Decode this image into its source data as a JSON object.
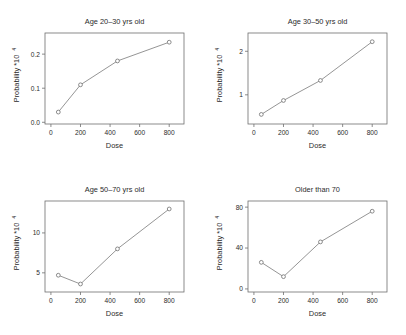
{
  "figure": {
    "title": "",
    "panel_count": 4,
    "layout": "2x2 grid of line charts",
    "shared_xlabel": "Dose",
    "shared_ylabel": "Probability *10",
    "ylabel_superscript": "4"
  },
  "chart_data": [
    {
      "type": "line",
      "title": "Age 20–30 yrs old",
      "xlabel": "Dose",
      "ylabel": "Probability *10⁴",
      "x": [
        50,
        200,
        450,
        800
      ],
      "values": [
        0.03,
        0.11,
        0.18,
        0.235
      ],
      "xticks": [
        0,
        200,
        400,
        600,
        800
      ],
      "xticklabels": [
        "0",
        "200",
        "400",
        "600",
        "800"
      ],
      "yticks": [
        0.0,
        0.1,
        0.2
      ],
      "yticklabels": [
        "0.0",
        "0.1",
        "0.2"
      ],
      "xlim": [
        -40,
        900
      ],
      "ylim": [
        -0.005,
        0.262
      ],
      "grid": false,
      "legend": "none",
      "marker": "open-circle"
    },
    {
      "type": "line",
      "title": "Age 30–50 yrs old",
      "xlabel": "Dose",
      "ylabel": "Probability *10⁴",
      "x": [
        50,
        200,
        450,
        800
      ],
      "values": [
        0.55,
        0.87,
        1.33,
        2.22
      ],
      "xticks": [
        0,
        200,
        400,
        600,
        800
      ],
      "xticklabels": [
        "0",
        "200",
        "400",
        "600",
        "800"
      ],
      "yticks": [
        1,
        2
      ],
      "yticklabels": [
        "1",
        "2"
      ],
      "xlim": [
        -40,
        900
      ],
      "ylim": [
        0.33,
        2.42
      ],
      "grid": false,
      "legend": "none",
      "marker": "open-circle"
    },
    {
      "type": "line",
      "title": "Age 50–70 yrs old",
      "xlabel": "Dose",
      "ylabel": "Probability *10⁴",
      "x": [
        50,
        200,
        450,
        800
      ],
      "values": [
        4.7,
        3.6,
        8.0,
        13.0
      ],
      "xticks": [
        0,
        200,
        400,
        600,
        800
      ],
      "xticklabels": [
        "0",
        "200",
        "400",
        "600",
        "800"
      ],
      "yticks": [
        5,
        10
      ],
      "yticklabels": [
        "5",
        "10"
      ],
      "xlim": [
        -40,
        900
      ],
      "ylim": [
        2.6,
        14.0
      ],
      "grid": false,
      "legend": "none",
      "marker": "open-circle"
    },
    {
      "type": "line",
      "title": "Older than 70",
      "xlabel": "Dose",
      "ylabel": "Probability *10⁴",
      "x": [
        50,
        200,
        450,
        800
      ],
      "values": [
        26,
        12,
        46,
        76
      ],
      "xticks": [
        0,
        200,
        400,
        600,
        800
      ],
      "xticklabels": [
        "0",
        "200",
        "400",
        "600",
        "800"
      ],
      "yticks": [
        0,
        40,
        80
      ],
      "yticklabels": [
        "0",
        "40",
        "80"
      ],
      "xlim": [
        -40,
        900
      ],
      "ylim": [
        -3,
        86
      ],
      "grid": false,
      "legend": "none",
      "marker": "open-circle"
    }
  ],
  "colors": {
    "background": "#ffffff",
    "axis": "#6e6e6e",
    "line": "#7a7a7a",
    "marker_fill": "#ffffff",
    "text": "#2b2b2b"
  }
}
